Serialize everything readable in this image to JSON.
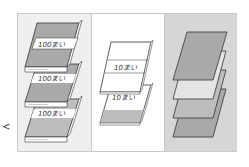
{
  "figure": {
    "panels": [
      {
        "name": "hundred-sheet-bundles",
        "label": "100まい",
        "count": 3,
        "background": "#efefef"
      },
      {
        "name": "ten-sheet-bundles",
        "label": "10まい",
        "count": 2,
        "background": "#ffffff"
      },
      {
        "name": "single-sheets",
        "label": "",
        "count": 4,
        "background": "#d6d6d6"
      }
    ],
    "side_mark": "<",
    "colors": {
      "sheet_gray": "#a9a9a9",
      "sheet_light": "#e4e4e4",
      "band": "#ffffff",
      "outline": "#333333",
      "frame": "#c8c8c8"
    }
  }
}
